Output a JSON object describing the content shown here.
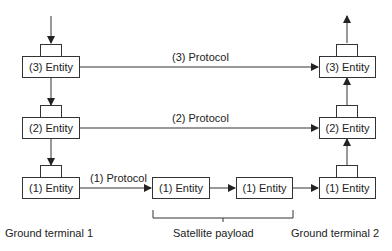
{
  "diagram": {
    "ground_terminal_1": {
      "label": "Ground terminal 1",
      "entities": [
        "(3) Entity",
        "(2) Entity",
        "(1) Entity"
      ]
    },
    "ground_terminal_2": {
      "label": "Ground terminal 2",
      "entities": [
        "(3) Entity",
        "(2) Entity",
        "(1) Entity"
      ]
    },
    "satellite_payload": {
      "label": "Satellite payload",
      "entities": [
        "(1) Entity",
        "(1) Entity"
      ]
    },
    "protocols": {
      "p3": "(3) Protocol",
      "p2": "(2) Protocol",
      "p1": "(1) Protocol"
    },
    "colors": {
      "line": "#333333",
      "text": "#222222",
      "background": "#ffffff"
    }
  }
}
